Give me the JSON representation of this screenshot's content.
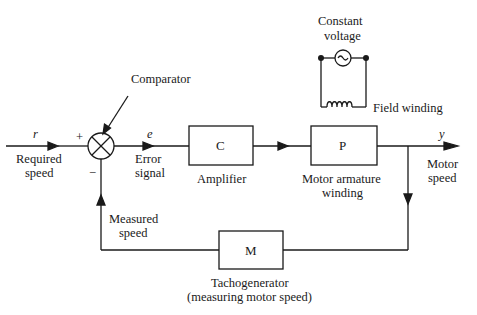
{
  "diagram": {
    "labels": {
      "comparator": "Comparator",
      "constant_voltage_1": "Constant",
      "constant_voltage_2": "voltage",
      "field_winding": "Field winding",
      "r": "r",
      "plus": "+",
      "minus": "−",
      "e": "e",
      "y": "y",
      "required_speed_1": "Required",
      "required_speed_2": "speed",
      "error_signal_1": "Error",
      "error_signal_2": "signal",
      "amplifier": "Amplifier",
      "motor_armature_1": "Motor armature",
      "motor_armature_2": "winding",
      "motor_speed_1": "Motor",
      "motor_speed_2": "speed",
      "measured_speed_1": "Measured",
      "measured_speed_2": "speed",
      "tacho_1": "Tachogenerator",
      "tacho_2": "(measuring motor speed)"
    },
    "blocks": {
      "amplifier": "C",
      "plant": "P",
      "sensor": "M"
    }
  }
}
